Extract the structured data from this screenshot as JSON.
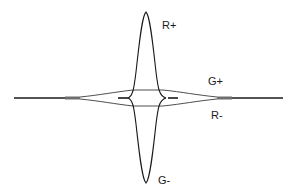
{
  "diagram": {
    "title": "",
    "labels": {
      "r_plus": "R+",
      "g_plus": "G+",
      "r_minus": "R-",
      "g_minus": "G-"
    },
    "colors": {
      "line": "#1a1a1a",
      "gray_segment": "#6e6e6e",
      "background": "#ffffff"
    }
  }
}
